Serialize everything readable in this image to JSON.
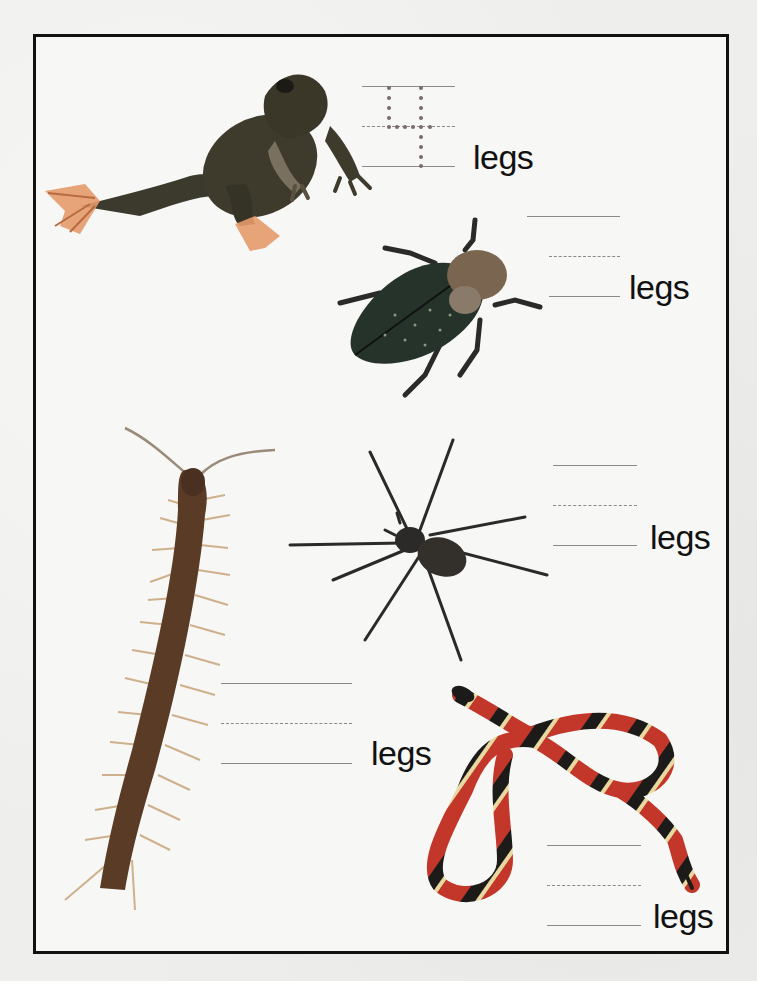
{
  "worksheet": {
    "title": "",
    "instruction": "",
    "unit_label": "legs",
    "items": [
      {
        "animal": "frog",
        "icon": "frog-icon",
        "answer_traced": "4",
        "label": "legs",
        "colors": {
          "body": "#3e3b2c",
          "feet": "#d98a55"
        }
      },
      {
        "animal": "beetle",
        "icon": "beetle-icon",
        "answer_traced": "",
        "label": "legs",
        "colors": {
          "body": "#2a3a2a",
          "head": "#8a6a4a"
        }
      },
      {
        "animal": "spider",
        "icon": "spider-icon",
        "answer_traced": "",
        "label": "legs",
        "colors": {
          "body": "#2b2a28"
        }
      },
      {
        "animal": "centipede",
        "icon": "centipede-icon",
        "answer_traced": "",
        "label": "legs",
        "colors": {
          "body": "#5a3b25",
          "legs": "#c79a6a"
        }
      },
      {
        "animal": "snake",
        "icon": "snake-icon",
        "answer_traced": "",
        "label": "legs",
        "colors": {
          "red": "#c2372a",
          "black": "#1d1b1a",
          "yellow": "#e8d9a0"
        }
      }
    ]
  },
  "colors": {
    "border": "#111111",
    "rule_line": "#8a8a8a",
    "trace_dot": "#7a6a6a",
    "text": "#111111"
  }
}
